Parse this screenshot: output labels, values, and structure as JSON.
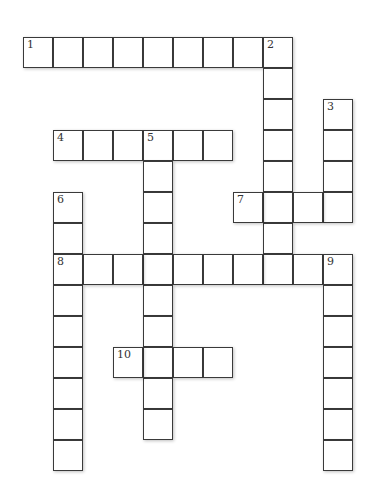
{
  "puzzle": {
    "type": "crossword",
    "cell_size": 30,
    "origin_x": 23,
    "origin_y": 37,
    "col_step": 30,
    "row_step": 31,
    "entries": [
      {
        "number": "1",
        "direction": "across",
        "row": 0,
        "col": 0,
        "length": 9
      },
      {
        "number": "2",
        "direction": "down",
        "row": 0,
        "col": 8,
        "length": 8
      },
      {
        "number": "3",
        "direction": "down",
        "row": 2,
        "col": 10,
        "length": 4
      },
      {
        "number": "4",
        "direction": "across",
        "row": 3,
        "col": 1,
        "length": 6
      },
      {
        "number": "5",
        "direction": "down",
        "row": 3,
        "col": 4,
        "length": 10
      },
      {
        "number": "6",
        "direction": "down",
        "row": 5,
        "col": 1,
        "length": 9
      },
      {
        "number": "7",
        "direction": "across",
        "row": 5,
        "col": 7,
        "length": 4
      },
      {
        "number": "8",
        "direction": "across",
        "row": 7,
        "col": 1,
        "length": 10
      },
      {
        "number": "9",
        "direction": "down",
        "row": 7,
        "col": 10,
        "length": 7
      },
      {
        "number": "10",
        "direction": "across",
        "row": 10,
        "col": 3,
        "length": 4
      }
    ]
  }
}
